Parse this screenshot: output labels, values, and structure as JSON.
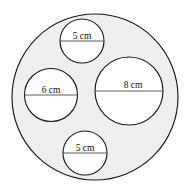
{
  "figure": {
    "units": "cm",
    "canvas": {
      "width": 190,
      "height": 194,
      "background": "#ffffff"
    },
    "colors": {
      "annulus_fill": "#efefef",
      "inner_fill": "#ffffff",
      "stroke": "#1a1a1a",
      "diameter_line": "#4a4a4a",
      "label_text": "#111111"
    },
    "outer_circle": {
      "name": "outer-circle",
      "cx": 95,
      "cy": 97,
      "r": 83,
      "label": ""
    },
    "inner_circles": [
      {
        "name": "circle-top-5cm",
        "label": "5 cm",
        "cx": 82,
        "cy": 41,
        "r": 22,
        "label_x": 82,
        "label_y": 39,
        "font_size": 9.5,
        "line_y": 41
      },
      {
        "name": "circle-left-6cm",
        "label": "6 cm",
        "cx": 51,
        "cy": 95,
        "r": 26.5,
        "label_x": 51,
        "label_y": 93,
        "font_size": 9.5,
        "line_y": 95
      },
      {
        "name": "circle-right-8cm",
        "label": "8 cm",
        "cx": 129,
        "cy": 91,
        "r": 34,
        "label_x": 133,
        "label_y": 88,
        "font_size": 9.5,
        "line_y": 91
      },
      {
        "name": "circle-bottom-5cm",
        "label": "5 cm",
        "cx": 85,
        "cy": 153,
        "r": 22,
        "label_x": 85,
        "label_y": 151,
        "font_size": 9.5,
        "line_y": 153
      }
    ]
  }
}
